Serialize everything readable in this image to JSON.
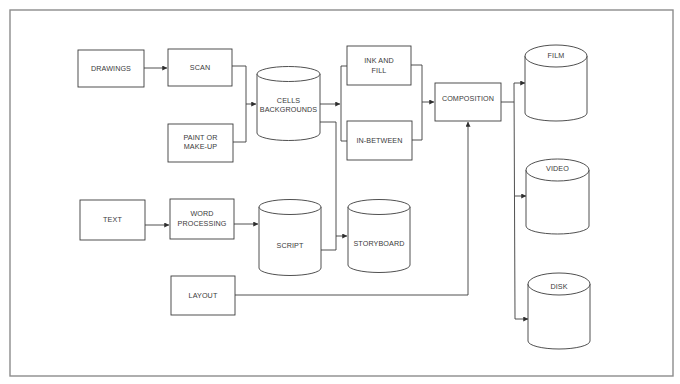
{
  "diagram": {
    "type": "flowchart",
    "colors": {
      "background": "#ffffff",
      "line": "#3c3c3c",
      "frame": "#8c8c8c",
      "text": "#3a3a3a"
    },
    "nodes": {
      "drawings": {
        "shape": "box",
        "lines": [
          "DRAWINGS"
        ]
      },
      "scan": {
        "shape": "box",
        "lines": [
          "SCAN"
        ]
      },
      "paint": {
        "shape": "box",
        "lines": [
          "PAINT OR",
          "MAKE-UP"
        ]
      },
      "cells": {
        "shape": "cylinder",
        "lines": [
          "CELLS",
          "BACKGROUNDS"
        ]
      },
      "ink_fill": {
        "shape": "box",
        "lines": [
          "INK AND",
          "FILL"
        ]
      },
      "in_between": {
        "shape": "box",
        "lines": [
          "IN-BETWEEN"
        ]
      },
      "composition": {
        "shape": "box",
        "lines": [
          "COMPOSITION"
        ]
      },
      "film": {
        "shape": "cylinder",
        "lines": [
          "FILM"
        ]
      },
      "video": {
        "shape": "cylinder",
        "lines": [
          "VIDEO"
        ]
      },
      "disk": {
        "shape": "cylinder",
        "lines": [
          "DISK"
        ]
      },
      "text": {
        "shape": "box",
        "lines": [
          "TEXT"
        ]
      },
      "word_processing": {
        "shape": "box",
        "lines": [
          "WORD",
          "PROCESSING"
        ]
      },
      "script": {
        "shape": "cylinder",
        "lines": [
          "SCRIPT"
        ]
      },
      "storyboard": {
        "shape": "cylinder",
        "lines": [
          "STORYBOARD"
        ]
      },
      "layout": {
        "shape": "box",
        "lines": [
          "LAYOUT"
        ]
      }
    },
    "edges": [
      {
        "from": "drawings",
        "to": "scan"
      },
      {
        "from": "scan",
        "to": "cells"
      },
      {
        "from": "paint",
        "to": "cells"
      },
      {
        "from": "cells",
        "to": "ink_fill"
      },
      {
        "from": "cells",
        "to": "in_between"
      },
      {
        "from": "ink_fill",
        "to": "composition"
      },
      {
        "from": "in_between",
        "to": "composition"
      },
      {
        "from": "cells",
        "to": "storyboard"
      },
      {
        "from": "text",
        "to": "word_processing"
      },
      {
        "from": "word_processing",
        "to": "script"
      },
      {
        "from": "script",
        "to": "storyboard"
      },
      {
        "from": "layout",
        "to": "composition"
      },
      {
        "from": "composition",
        "to": "film"
      },
      {
        "from": "composition",
        "to": "video"
      },
      {
        "from": "composition",
        "to": "disk"
      }
    ]
  }
}
